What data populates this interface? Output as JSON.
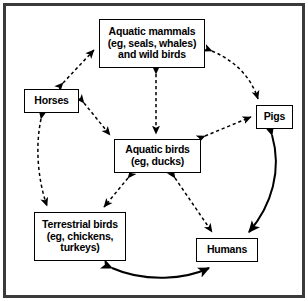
{
  "figure": {
    "border_color": "#3a3a3a",
    "background_color": "#ffffff",
    "line_color": "#000000",
    "width": 308,
    "height": 301
  },
  "nodes": {
    "aquatic_mammals": {
      "id": "aquatic-mammals",
      "lines": [
        "Aquatic mammals",
        "(eg, seals, whales)",
        "and wild birds"
      ]
    },
    "horses": {
      "id": "horses",
      "lines": [
        "Horses"
      ]
    },
    "pigs": {
      "id": "pigs",
      "lines": [
        "Pigs"
      ]
    },
    "aquatic_birds": {
      "id": "aquatic-birds",
      "lines": [
        "Aquatic birds",
        "(eg, ducks)"
      ]
    },
    "terrestrial_birds": {
      "id": "terrestrial-birds",
      "lines": [
        "Terrestrial birds",
        "(eg, chickens,",
        "turkeys)"
      ]
    },
    "humans": {
      "id": "humans",
      "lines": [
        "Humans"
      ]
    }
  },
  "edges": [
    {
      "name": "horses-aquatic-mammals",
      "from": "horses",
      "to": "aquatic_mammals",
      "style": "dashed",
      "heads": "both"
    },
    {
      "name": "aquatic-mammals-pigs",
      "from": "aquatic_mammals",
      "to": "pigs",
      "style": "dashed",
      "heads": "both"
    },
    {
      "name": "aquatic-mammals-aquatic-birds",
      "from": "aquatic_mammals",
      "to": "aquatic_birds",
      "style": "dashed",
      "heads": "both"
    },
    {
      "name": "horses-aquatic-birds",
      "from": "horses",
      "to": "aquatic_birds",
      "style": "dashed",
      "heads": "both"
    },
    {
      "name": "aquatic-birds-pigs",
      "from": "aquatic_birds",
      "to": "pigs",
      "style": "dashed",
      "heads": "both"
    },
    {
      "name": "horses-terrestrial-birds",
      "from": "horses",
      "to": "terrestrial_birds",
      "style": "dashed",
      "heads": "both"
    },
    {
      "name": "aquatic-birds-terrestrial-birds",
      "from": "aquatic_birds",
      "to": "terrestrial_birds",
      "style": "dashed",
      "heads": "both"
    },
    {
      "name": "aquatic-birds-humans",
      "from": "aquatic_birds",
      "to": "humans",
      "style": "dashed",
      "heads": "both"
    },
    {
      "name": "pigs-humans",
      "from": "pigs",
      "to": "humans",
      "style": "solid",
      "heads": "both"
    },
    {
      "name": "terrestrial-birds-humans",
      "from": "terrestrial_birds",
      "to": "humans",
      "style": "solid",
      "heads": "both"
    }
  ]
}
